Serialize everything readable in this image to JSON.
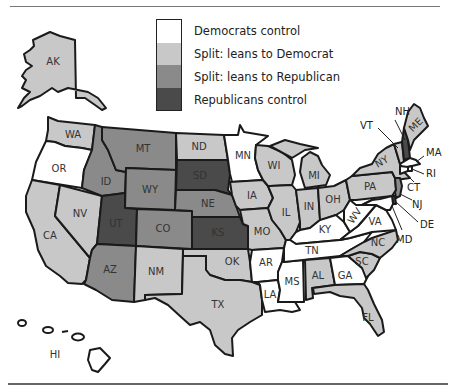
{
  "colors": {
    "dem_control": "#ffffff",
    "lean_dem": "#c8c8c8",
    "lean_rep": "#8a8a8a",
    "rep_control": "#4a4a4a",
    "border": "#1a1a1a"
  },
  "legend": {
    "items": [
      {
        "key": "dem_control",
        "label": "Democrats control"
      },
      {
        "key": "lean_dem",
        "label": "Split: leans to Democrat"
      },
      {
        "key": "lean_rep",
        "label": "Split: leans to Republican"
      },
      {
        "key": "rep_control",
        "label": "Republicans control"
      }
    ]
  },
  "states": {
    "AK": {
      "label": "AK",
      "category": "lean_dem"
    },
    "HI": {
      "label": "HI",
      "category": "dem_control"
    },
    "WA": {
      "label": "WA",
      "category": "lean_dem"
    },
    "OR": {
      "label": "OR",
      "category": "dem_control"
    },
    "CA": {
      "label": "CA",
      "category": "lean_dem"
    },
    "NV": {
      "label": "NV",
      "category": "lean_dem"
    },
    "ID": {
      "label": "ID",
      "category": "lean_rep"
    },
    "MT": {
      "label": "MT",
      "category": "lean_rep"
    },
    "WY": {
      "label": "WY",
      "category": "lean_rep"
    },
    "UT": {
      "label": "UT",
      "category": "rep_control"
    },
    "CO": {
      "label": "CO",
      "category": "lean_rep"
    },
    "AZ": {
      "label": "AZ",
      "category": "lean_rep"
    },
    "NM": {
      "label": "NM",
      "category": "lean_dem"
    },
    "ND": {
      "label": "ND",
      "category": "lean_dem"
    },
    "SD": {
      "label": "SD",
      "category": "rep_control"
    },
    "NE": {
      "label": "NE",
      "category": "lean_rep"
    },
    "KS": {
      "label": "KS",
      "category": "rep_control"
    },
    "OK": {
      "label": "OK",
      "category": "lean_dem"
    },
    "TX": {
      "label": "TX",
      "category": "lean_dem"
    },
    "MN": {
      "label": "MN",
      "category": "dem_control"
    },
    "IA": {
      "label": "IA",
      "category": "lean_dem"
    },
    "MO": {
      "label": "MO",
      "category": "lean_dem"
    },
    "AR": {
      "label": "AR",
      "category": "dem_control"
    },
    "LA": {
      "label": "LA",
      "category": "dem_control"
    },
    "WI": {
      "label": "WI",
      "category": "lean_dem"
    },
    "IL": {
      "label": "IL",
      "category": "lean_dem"
    },
    "MI": {
      "label": "MI",
      "category": "lean_dem"
    },
    "IN": {
      "label": "IN",
      "category": "lean_dem"
    },
    "OH": {
      "label": "OH",
      "category": "lean_dem"
    },
    "KY": {
      "label": "KY",
      "category": "dem_control"
    },
    "TN": {
      "label": "TN",
      "category": "dem_control"
    },
    "MS": {
      "label": "MS",
      "category": "dem_control"
    },
    "AL": {
      "label": "AL",
      "category": "lean_dem"
    },
    "GA": {
      "label": "GA",
      "category": "dem_control"
    },
    "FL": {
      "label": "FL",
      "category": "lean_dem"
    },
    "SC": {
      "label": "SC",
      "category": "lean_dem"
    },
    "NC": {
      "label": "NC",
      "category": "lean_dem"
    },
    "VA": {
      "label": "VA",
      "category": "dem_control"
    },
    "WV": {
      "label": "WV",
      "category": "dem_control"
    },
    "PA": {
      "label": "PA",
      "category": "lean_dem"
    },
    "NY": {
      "label": "NY",
      "category": "lean_dem"
    },
    "VT": {
      "label": "VT",
      "category": "lean_dem"
    },
    "NH": {
      "label": "NH",
      "category": "rep_control"
    },
    "ME": {
      "label": "ME",
      "category": "lean_dem"
    },
    "MA": {
      "label": "MA",
      "category": "dem_control"
    },
    "RI": {
      "label": "RI",
      "category": "dem_control"
    },
    "CT": {
      "label": "CT",
      "category": "dem_control"
    },
    "NJ": {
      "label": "NJ",
      "category": "lean_rep"
    },
    "DE": {
      "label": "DE",
      "category": "rep_control"
    },
    "MD": {
      "label": "MD",
      "category": "dem_control"
    }
  }
}
